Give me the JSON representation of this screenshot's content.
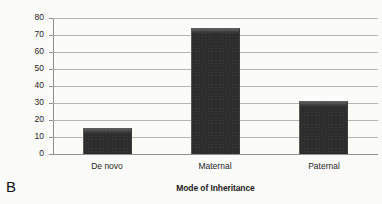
{
  "panel": {
    "label": "B"
  },
  "chart_data": {
    "type": "bar",
    "title": "",
    "xlabel": "Mode of Inheritance",
    "ylabel": "Number of Cases",
    "categories": [
      "De novo",
      "Maternal",
      "Paternal"
    ],
    "values": [
      15,
      74,
      31
    ],
    "series": [
      {
        "name": "Number of Cases",
        "values": [
          15,
          74,
          31
        ]
      }
    ],
    "ylim": [
      0,
      80
    ],
    "yticks": [
      0,
      10,
      20,
      30,
      40,
      50,
      60,
      70,
      80
    ],
    "ytick_labels": [
      "0",
      "10",
      "20",
      "30",
      "40",
      "50",
      "60",
      "70",
      "80"
    ],
    "grid": true,
    "grid_axis": "y",
    "legend": false,
    "legend_position": "none",
    "bar_color": "#2d2d2d",
    "gridline_color": "#b4b4b4",
    "axis_color": "#8e8e8e",
    "background_color": "#fbfbfa",
    "text_color": "#1d1d1d"
  }
}
